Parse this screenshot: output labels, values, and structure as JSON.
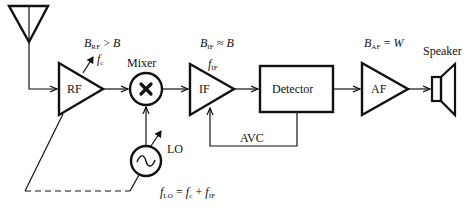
{
  "diagram": {
    "blocks": {
      "rf": {
        "label": "RF"
      },
      "mixer": {
        "label": "Mixer",
        "symbol": "✖"
      },
      "if": {
        "label": "IF"
      },
      "detector": {
        "label": "Detector"
      },
      "af": {
        "label": "AF"
      },
      "lo": {
        "label": "LO",
        "symbol": "~"
      },
      "speaker": {
        "label": "Speaker"
      },
      "avc": {
        "label": "AVC"
      }
    },
    "annotations": {
      "rf_bandwidth": {
        "var": "B",
        "sub": "RF",
        "rel": " > ",
        "rhs": "B"
      },
      "rf_tuning": {
        "var": "f",
        "sub": "c"
      },
      "if_bandwidth": {
        "var": "B",
        "sub": "IF",
        "rel": " ≈ ",
        "rhs": "B"
      },
      "if_freq": {
        "var": "f",
        "sub": "IF"
      },
      "af_bandwidth": {
        "var": "B",
        "sub": "AF",
        "rel": " = ",
        "rhs": "W"
      },
      "lo_freq": {
        "var": "f",
        "sub": "LO",
        "rel": " = ",
        "t1": "f",
        "t1sub": "c",
        "plus": " + ",
        "t2": "f",
        "t2sub": "IF"
      }
    },
    "colors": {
      "stroke": "#111111",
      "background": "#ffffff"
    }
  }
}
